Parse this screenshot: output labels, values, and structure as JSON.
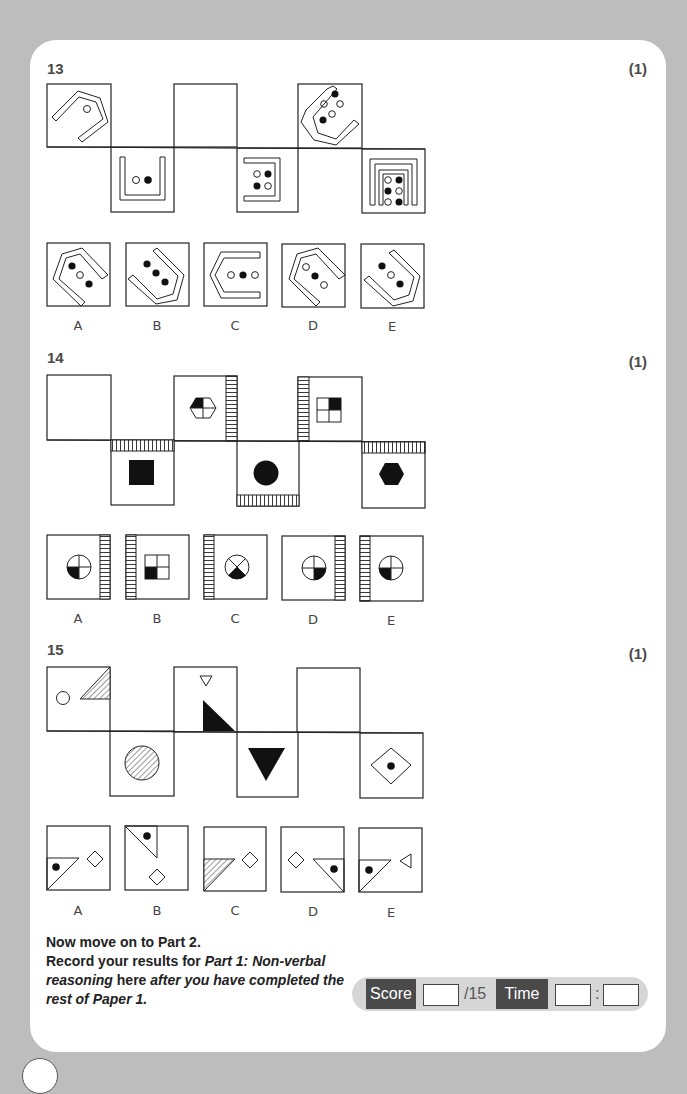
{
  "questions": [
    {
      "number": "13",
      "mark": "(1)",
      "options": [
        "A",
        "B",
        "C",
        "D",
        "E"
      ]
    },
    {
      "number": "14",
      "mark": "(1)",
      "options": [
        "A",
        "B",
        "C",
        "D",
        "E"
      ]
    },
    {
      "number": "15",
      "mark": "(1)",
      "options": [
        "A",
        "B",
        "C",
        "D",
        "E"
      ]
    }
  ],
  "footer": {
    "line1": "Now move on to Part 2.",
    "line2_a": "Record your results for ",
    "line2_b": "Part 1: Non-verbal reasoning",
    "line2_c": " here ",
    "line2_d": "after you have completed the rest of Paper 1."
  },
  "scorebar": {
    "score_label": "Score",
    "score_value": "",
    "score_total": "/15",
    "time_label": "Time",
    "time_minutes": "",
    "time_separator": ":",
    "time_seconds": ""
  }
}
